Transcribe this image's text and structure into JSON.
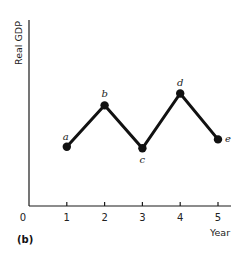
{
  "chart_data": {
    "type": "line",
    "title": "",
    "panel_label": "(b)",
    "xlabel": "Year",
    "ylabel": "Real GDP",
    "origin_label": "0",
    "x": [
      1,
      2,
      3,
      4,
      5
    ],
    "x_tick_labels": [
      "1",
      "2",
      "3",
      "4",
      "5"
    ],
    "xlim": [
      0,
      5.3
    ],
    "ylim": [
      0,
      10
    ],
    "grid": false,
    "legend": "none",
    "series": [
      {
        "name": "Real GDP",
        "values": [
          4.0,
          6.8,
          3.9,
          7.6,
          4.5
        ],
        "point_labels": [
          "a",
          "b",
          "c",
          "d",
          "e"
        ],
        "color": "#111111"
      }
    ]
  }
}
